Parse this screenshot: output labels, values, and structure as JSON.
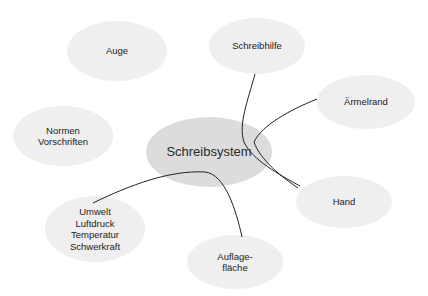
{
  "diagram": {
    "type": "mind-map",
    "colors": {
      "center_fill": "#dcdcdc",
      "node_fill": "#efefef",
      "line": "#222222",
      "text": "#222222"
    },
    "center": {
      "id": "schreibsystem",
      "label": "Schreibsystem",
      "cx": 209,
      "cy": 152,
      "rx": 63,
      "ry": 35
    },
    "nodes": [
      {
        "id": "auge",
        "label": "Auge",
        "cx": 117,
        "cy": 51,
        "rx": 50,
        "ry": 30
      },
      {
        "id": "schreibhilfe",
        "label": "Schreibhilfe",
        "cx": 257,
        "cy": 46,
        "rx": 48,
        "ry": 28
      },
      {
        "id": "aermelrand",
        "label": "Ärmelrand",
        "cx": 366,
        "cy": 102,
        "rx": 49,
        "ry": 27
      },
      {
        "id": "normen",
        "label": "Normen\nVorschriften",
        "cx": 63,
        "cy": 136,
        "rx": 50,
        "ry": 30
      },
      {
        "id": "hand",
        "label": "Hand",
        "cx": 344,
        "cy": 202,
        "rx": 48,
        "ry": 26
      },
      {
        "id": "umwelt",
        "label": "Umwelt\nLuftdruck\nTemperatur\nSchwerkraft",
        "cx": 95,
        "cy": 229,
        "rx": 50,
        "ry": 33
      },
      {
        "id": "auflageflaeche",
        "label": "Auflage-\nfläche",
        "cx": 235,
        "cy": 262,
        "rx": 48,
        "ry": 27
      }
    ],
    "connections": [
      {
        "from": "schreibhilfe",
        "to": "hand"
      },
      {
        "from": "aermelrand",
        "to": "hand"
      },
      {
        "from": "umwelt",
        "to": "auflageflaeche"
      }
    ]
  }
}
